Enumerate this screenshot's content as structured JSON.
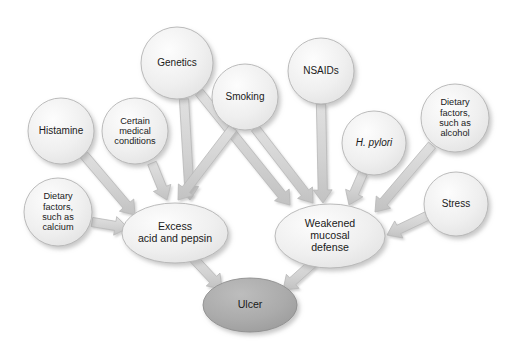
{
  "diagram": {
    "type": "flow-diagram",
    "colors": {
      "background": "#ffffff",
      "node_fill_light": "#ededed",
      "node_fill_dark": "#a9a9a9",
      "node_stroke": "#b4b4b4",
      "arrow_fill": "#d2d2d2",
      "arrow_stroke": "#b8b8b8",
      "text": "#1a1a1a",
      "shadow": "#c9c9c9"
    },
    "nodes": [
      {
        "id": "histamine",
        "label": "Histamine",
        "shape": "circle",
        "style": "light",
        "cx": 61,
        "cy": 131,
        "rx": 33,
        "ry": 33,
        "size": "md"
      },
      {
        "id": "dietary_calcium",
        "label": "Dietary\nfactors,\nsuch as\ncalcium",
        "shape": "circle",
        "style": "light",
        "cx": 58,
        "cy": 212,
        "rx": 34,
        "ry": 34,
        "size": "sm"
      },
      {
        "id": "certain_medical",
        "label": "Certain\nmedical\nconditions",
        "shape": "circle",
        "style": "light",
        "cx": 135,
        "cy": 131,
        "rx": 33,
        "ry": 33,
        "size": "sm"
      },
      {
        "id": "genetics",
        "label": "Genetics",
        "shape": "circle",
        "style": "light",
        "cx": 177,
        "cy": 63,
        "rx": 36,
        "ry": 36,
        "size": "md"
      },
      {
        "id": "smoking",
        "label": "Smoking",
        "shape": "circle",
        "style": "light",
        "cx": 245,
        "cy": 97,
        "rx": 33,
        "ry": 33,
        "size": "md"
      },
      {
        "id": "nsaids",
        "label": "NSAIDs",
        "shape": "circle",
        "style": "light",
        "cx": 321,
        "cy": 71,
        "rx": 33,
        "ry": 33,
        "size": "md"
      },
      {
        "id": "h_pylori",
        "label": "H. pylori",
        "shape": "circle",
        "style": "light",
        "cx": 374,
        "cy": 143,
        "rx": 32,
        "ry": 32,
        "size": "md",
        "italic": true
      },
      {
        "id": "dietary_alcohol",
        "label": "Dietary\nfactors,\nsuch as\nalcohol",
        "shape": "circle",
        "style": "light",
        "cx": 455,
        "cy": 118,
        "rx": 34,
        "ry": 34,
        "size": "sm"
      },
      {
        "id": "stress",
        "label": "Stress",
        "shape": "circle",
        "style": "light",
        "cx": 456,
        "cy": 204,
        "rx": 32,
        "ry": 32,
        "size": "md"
      },
      {
        "id": "excess_acid",
        "label": "Excess\nacid and pepsin",
        "shape": "ellipse",
        "style": "light",
        "cx": 175,
        "cy": 233,
        "rx": 53,
        "ry": 30,
        "size": "lg"
      },
      {
        "id": "weakened_mucosal",
        "label": "Weakened\nmucosal\ndefense",
        "shape": "ellipse",
        "style": "light",
        "cx": 330,
        "cy": 236,
        "rx": 55,
        "ry": 32,
        "size": "lg"
      },
      {
        "id": "ulcer",
        "label": "Ulcer",
        "shape": "ellipse",
        "style": "dark",
        "cx": 250,
        "cy": 305,
        "rx": 47,
        "ry": 27,
        "size": "lg"
      }
    ],
    "edges": [
      {
        "from": "histamine",
        "to": "excess_acid",
        "x1": 84,
        "y1": 155,
        "x2": 135,
        "y2": 215
      },
      {
        "from": "dietary_calcium",
        "to": "excess_acid",
        "x1": 92,
        "y1": 222,
        "x2": 128,
        "y2": 228
      },
      {
        "from": "certain_medical",
        "to": "excess_acid",
        "x1": 152,
        "y1": 163,
        "x2": 167,
        "y2": 200
      },
      {
        "from": "genetics",
        "to": "excess_acid",
        "x1": 184,
        "y1": 99,
        "x2": 190,
        "y2": 200
      },
      {
        "from": "genetics",
        "to": "weakened_mucosal",
        "x1": 199,
        "y1": 92,
        "x2": 290,
        "y2": 205
      },
      {
        "from": "smoking",
        "to": "excess_acid",
        "x1": 233,
        "y1": 128,
        "x2": 178,
        "y2": 200
      },
      {
        "from": "smoking",
        "to": "weakened_mucosal",
        "x1": 255,
        "y1": 128,
        "x2": 313,
        "y2": 203
      },
      {
        "from": "nsaids",
        "to": "weakened_mucosal",
        "x1": 321,
        "y1": 104,
        "x2": 323,
        "y2": 203
      },
      {
        "from": "h_pylori",
        "to": "weakened_mucosal",
        "x1": 363,
        "y1": 173,
        "x2": 349,
        "y2": 205
      },
      {
        "from": "dietary_alcohol",
        "to": "weakened_mucosal",
        "x1": 432,
        "y1": 145,
        "x2": 375,
        "y2": 212
      },
      {
        "from": "stress",
        "to": "weakened_mucosal",
        "x1": 427,
        "y1": 216,
        "x2": 387,
        "y2": 235
      },
      {
        "from": "excess_acid",
        "to": "ulcer",
        "x1": 193,
        "y1": 258,
        "x2": 222,
        "y2": 289
      },
      {
        "from": "weakened_mucosal",
        "to": "ulcer",
        "x1": 313,
        "y1": 263,
        "x2": 283,
        "y2": 290
      }
    ]
  }
}
